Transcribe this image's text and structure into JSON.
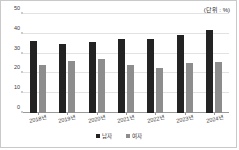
{
  "unit_note": "(단위 : %)",
  "legend": {
    "position": "bottom-center",
    "items": [
      {
        "label": "남자",
        "color": "#232323",
        "key": "male"
      },
      {
        "label": "여자",
        "color": "#8d8d8d",
        "key": "female"
      }
    ]
  },
  "axis": {
    "y_ticks": [
      "0",
      "10",
      "20",
      "30",
      "40",
      "50"
    ],
    "x_ticks": [
      "2018년",
      "2019년",
      "2020년",
      "2021년",
      "2022년",
      "2023년",
      "2024년"
    ]
  },
  "chart_data": {
    "type": "bar",
    "title": "",
    "subtitle": "",
    "xlabel": "",
    "ylabel": "",
    "unit": "%",
    "unit_note": "(단위 : %)",
    "grid": true,
    "legend_position": "bottom-center",
    "ylim": [
      0,
      50
    ],
    "ytick_interval": 10,
    "yticks": [
      0,
      10,
      20,
      30,
      40,
      50
    ],
    "categories": [
      "2018년",
      "2019년",
      "2020년",
      "2021년",
      "2022년",
      "2023년",
      "2024년"
    ],
    "series": [
      {
        "name": "남자",
        "color": "#232323",
        "values": [
          36.3,
          35.0,
          35.9,
          37.3,
          37.4,
          39.2,
          41.7
        ]
      },
      {
        "name": "여자",
        "color": "#8d8d8d",
        "values": [
          24.4,
          26.5,
          27.5,
          24.3,
          22.7,
          25.1,
          25.6
        ]
      }
    ]
  }
}
